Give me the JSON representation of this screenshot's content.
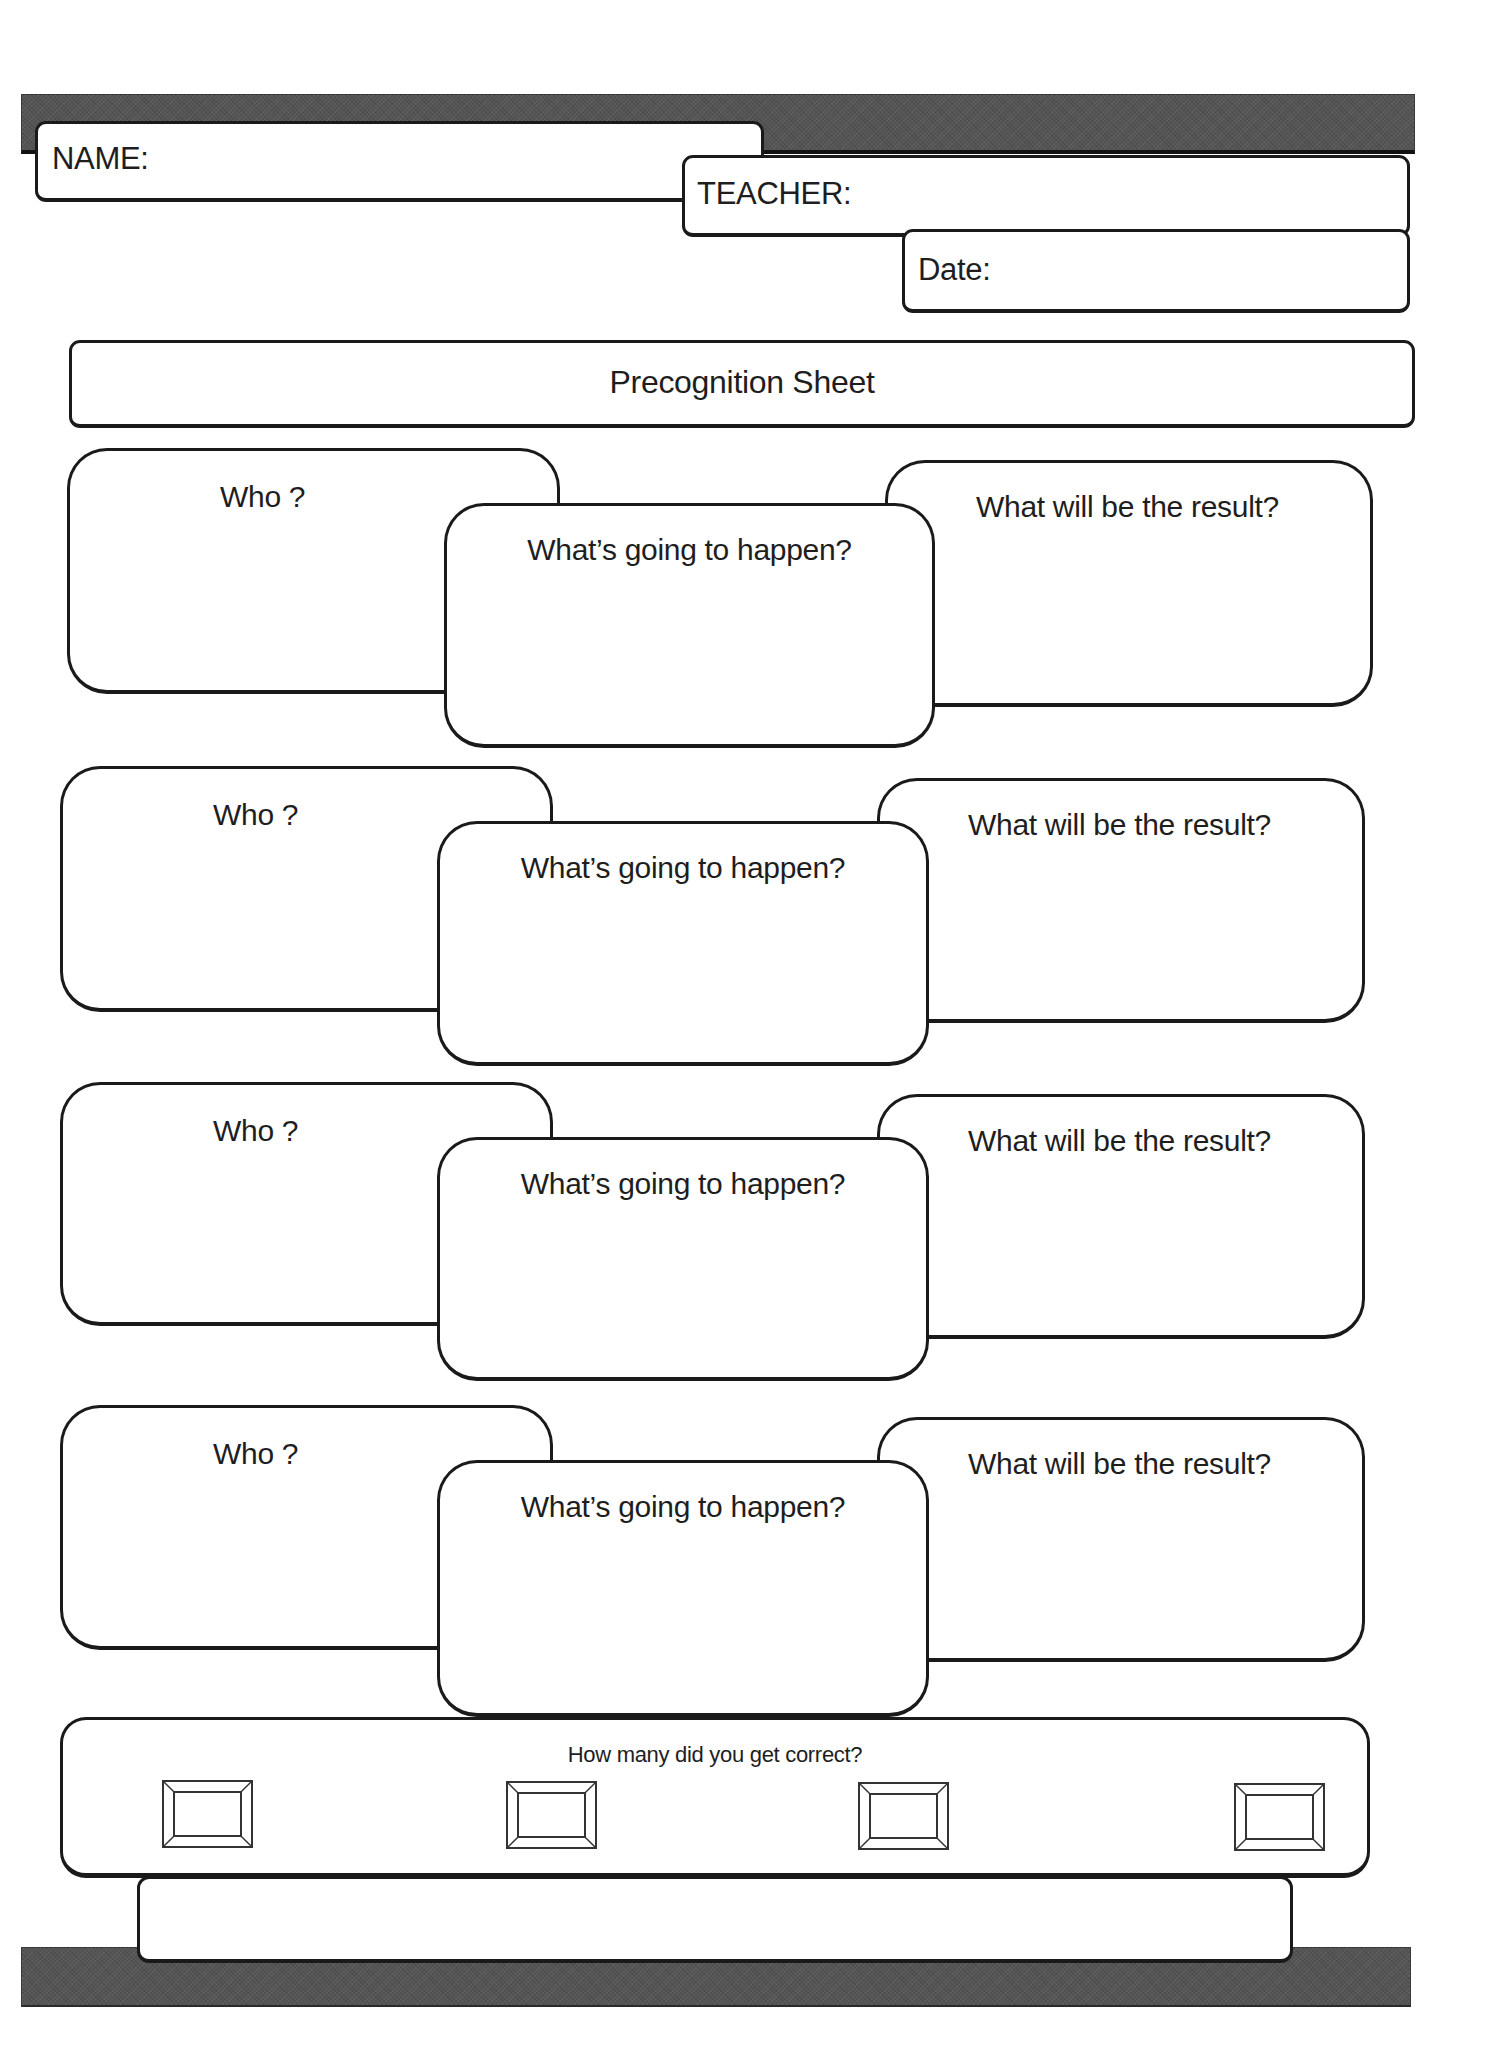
{
  "header": {
    "name_label": "NAME:",
    "teacher_label": "TEACHER:",
    "date_label": "Date:"
  },
  "title": "Precognition Sheet",
  "prediction_rows": [
    {
      "who": "Who ?",
      "what_happens": "What’s going to happen?",
      "result": "What will be the result?"
    },
    {
      "who": "Who ?",
      "what_happens": "What’s going to happen?",
      "result": "What will be the result?"
    },
    {
      "who": "Who ?",
      "what_happens": "What’s going to happen?",
      "result": "What will be the result?"
    },
    {
      "who": "Who ?",
      "what_happens": "What’s going to happen?",
      "result": "What will be the result?"
    }
  ],
  "score": {
    "question": "How many did you get correct?",
    "boxes": [
      "",
      "",
      "",
      ""
    ]
  },
  "footer_box": "",
  "colors": {
    "band": "#555555",
    "stroke": "#1a1a1a",
    "paper": "#ffffff"
  }
}
